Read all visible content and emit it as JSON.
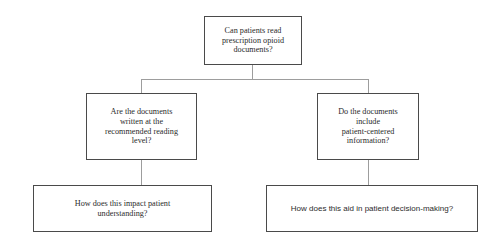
{
  "diagram": {
    "nodes": {
      "root": {
        "label": "Can patients read\nprescription opioid\ndocuments?"
      },
      "reading_level": {
        "label": "Are the documents\nwritten at the\nrecommended reading\nlevel?"
      },
      "patient_centered": {
        "label": "Do the documents\ninclude\npatient-centered\ninformation?"
      },
      "impact": {
        "label": "How does this impact patient\nunderstanding?"
      },
      "decision": {
        "label": "How does this aid in patient decision-making?"
      }
    },
    "colors": {
      "background": "#ffffff",
      "box_border": "#4a4a4a",
      "connector": "#9d9d9d",
      "text": "#2b2b2b"
    }
  }
}
